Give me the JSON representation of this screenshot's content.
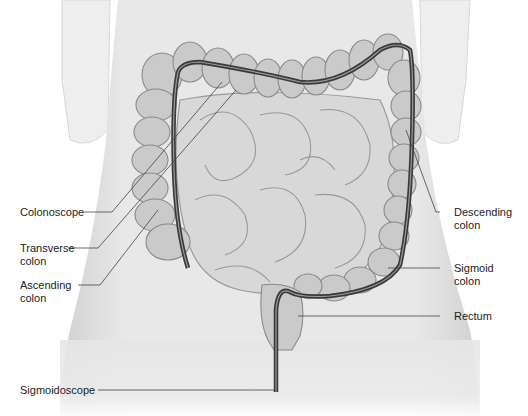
{
  "figure": {
    "colors": {
      "background": "#ffffff",
      "torso": "#e9e9e9",
      "torso_shadow": "#d2d2d2",
      "colon": "#c9c9c9",
      "colon_outline": "#8a8a8a",
      "intestine": "#d6d6d6",
      "scope": "#3a3a3a",
      "leader_line": "#444444",
      "label_text": "#222222"
    }
  },
  "labels": {
    "colonoscope": "Colonoscope",
    "transverse_colon": "Transverse\ncolon",
    "ascending_colon": "Ascending\ncolon",
    "sigmoidoscope": "Sigmoidoscope",
    "descending_colon": "Descending\ncolon",
    "sigmoid_colon": "Sigmoid\ncolon",
    "rectum": "Rectum"
  }
}
